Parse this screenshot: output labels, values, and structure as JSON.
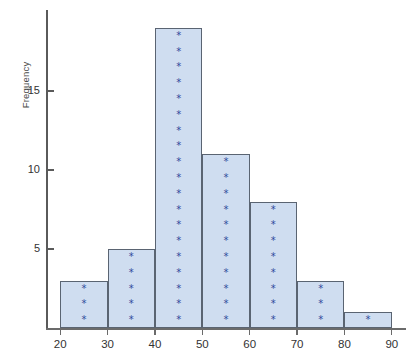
{
  "chart_data": {
    "type": "bar",
    "title": "",
    "xlabel": "",
    "ylabel": "Frequency",
    "categories": [
      "20-30",
      "30-40",
      "40-50",
      "50-60",
      "60-70",
      "70-80",
      "80-90"
    ],
    "bin_edges": [
      20,
      30,
      40,
      50,
      60,
      70,
      80,
      90
    ],
    "values": [
      3,
      5,
      19,
      11,
      8,
      3,
      1
    ],
    "bin_centers": [
      25,
      35,
      45,
      55,
      65,
      75,
      85
    ],
    "xlim": [
      17,
      93
    ],
    "ylim": [
      0,
      19
    ],
    "xticks": [
      20,
      30,
      40,
      50,
      60,
      70,
      80,
      90
    ],
    "yticks": [
      5,
      10,
      15
    ],
    "xtick_labels": [
      "20",
      "30",
      "40",
      "50",
      "60",
      "70",
      "80",
      "90"
    ],
    "ytick_labels": [
      "5",
      "10",
      "15"
    ],
    "grid": false,
    "legend": null,
    "marker": "*",
    "marker_note": "one asterisk plotted per unit of frequency, stacked in each bin",
    "colors": {
      "bar_fill": "#cfddf0",
      "bar_edge": "#5a6472",
      "marker": "#30499b",
      "axis": "#5a5a5a",
      "text": "#333333",
      "background": "#ffffff"
    }
  },
  "axes": {
    "y_axis_title": "Frequency"
  }
}
